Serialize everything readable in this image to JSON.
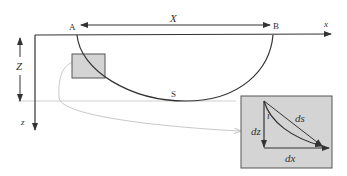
{
  "diagram": {
    "labels": {
      "point_a": "A",
      "point_b": "B",
      "span_x": "X",
      "axis_x": "x",
      "axis_z": "z",
      "depth_z": "Z",
      "point_s": "S"
    },
    "inset": {
      "angle": "i",
      "ds": "ds",
      "dz": "dz",
      "dx": "dx"
    },
    "colors": {
      "line": "#333333",
      "box_fill": "#d4d4d4",
      "box_stroke": "#555555",
      "connector": "#c8c8c8"
    }
  }
}
